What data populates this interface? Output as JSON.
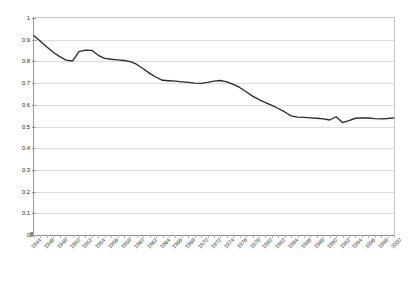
{
  "chart_data": {
    "type": "line",
    "title": "",
    "subtitle": "",
    "xlabel": "",
    "ylabel": "",
    "ylim": [
      0,
      1
    ],
    "ytick_step": 0.1,
    "yticks": [
      "0",
      "0.1",
      "0.2",
      "0.3",
      "0.4",
      "0.5",
      "0.6",
      "0.7",
      "0.8",
      "0.9",
      "1"
    ],
    "grid": true,
    "legend": "none",
    "xlabel_rotation_deg": -45,
    "xtick_label_interval_years": 2,
    "xtick_labels": [
      "1944",
      "1946",
      "1948",
      "1950",
      "1952",
      "1954",
      "1956",
      "1958",
      "1960",
      "1962",
      "1964",
      "1966",
      "1968",
      "1970",
      "1972",
      "1974",
      "1976",
      "1978",
      "1980",
      "1982",
      "1984",
      "1986",
      "1988",
      "1990",
      "1992",
      "1994",
      "1996",
      "1998",
      "2000"
    ],
    "series": [
      {
        "name": "series-1",
        "color": "#2b2b2b",
        "x": [
          1944,
          1945,
          1946,
          1947,
          1948,
          1949,
          1950,
          1951,
          1952,
          1953,
          1954,
          1955,
          1956,
          1957,
          1958,
          1959,
          1960,
          1961,
          1962,
          1963,
          1964,
          1965,
          1966,
          1967,
          1968,
          1969,
          1970,
          1971,
          1972,
          1973,
          1974,
          1975,
          1976,
          1977,
          1978,
          1979,
          1980,
          1981,
          1982,
          1983,
          1984,
          1985,
          1986,
          1987,
          1988,
          1989,
          1990,
          1991,
          1992,
          1993,
          1994,
          1995,
          1996,
          1997,
          1998,
          1999,
          2000
        ],
        "values": [
          0.918,
          0.893,
          0.866,
          0.842,
          0.822,
          0.806,
          0.802,
          0.845,
          0.852,
          0.851,
          0.828,
          0.814,
          0.81,
          0.807,
          0.804,
          0.799,
          0.786,
          0.766,
          0.745,
          0.727,
          0.713,
          0.711,
          0.709,
          0.706,
          0.703,
          0.7,
          0.699,
          0.703,
          0.709,
          0.712,
          0.706,
          0.694,
          0.68,
          0.66,
          0.64,
          0.624,
          0.61,
          0.597,
          0.583,
          0.567,
          0.549,
          0.543,
          0.542,
          0.54,
          0.538,
          0.535,
          0.53,
          0.545,
          0.518,
          0.527,
          0.538,
          0.54,
          0.539,
          0.536,
          0.535,
          0.537,
          0.54
        ]
      }
    ],
    "series_tail_note": ""
  },
  "chart_data_extended": {
    "x_full": [
      1944,
      1945,
      1946,
      1947,
      1948,
      1949,
      1950,
      1951,
      1952,
      1953,
      1954,
      1955,
      1956,
      1957,
      1958,
      1959,
      1960,
      1961,
      1962,
      1963,
      1964,
      1965,
      1966,
      1967,
      1968,
      1969,
      1970,
      1971,
      1972,
      1973,
      1974,
      1975,
      1976,
      1977,
      1978,
      1979,
      1980,
      1981,
      1982,
      1983,
      1984,
      1985,
      1986,
      1987,
      1988,
      1989,
      1990,
      1991,
      1992,
      1993,
      1994,
      1995,
      1996,
      1997,
      1998,
      1999,
      2000
    ],
    "y_full": [
      0.918,
      0.893,
      0.866,
      0.842,
      0.822,
      0.806,
      0.802,
      0.845,
      0.852,
      0.851,
      0.828,
      0.814,
      0.81,
      0.807,
      0.804,
      0.799,
      0.786,
      0.766,
      0.745,
      0.727,
      0.713,
      0.711,
      0.709,
      0.706,
      0.703,
      0.7,
      0.699,
      0.703,
      0.709,
      0.712,
      0.706,
      0.694,
      0.68,
      0.66,
      0.64,
      0.624,
      0.61,
      0.597,
      0.583,
      0.567,
      0.549,
      0.543,
      0.542,
      0.54,
      0.538,
      0.535,
      0.53,
      0.545,
      0.518,
      0.527,
      0.538,
      0.54,
      0.539,
      0.536,
      0.535,
      0.537,
      0.54
    ]
  },
  "plot": {
    "x_min": 1944,
    "x_max": 2000,
    "y_min": 0,
    "y_max": 1,
    "line_color": "#2b2b2b",
    "grid_color": "#dcdcdc",
    "axis_color": "#8d8d8d",
    "background": "#ffffff"
  }
}
